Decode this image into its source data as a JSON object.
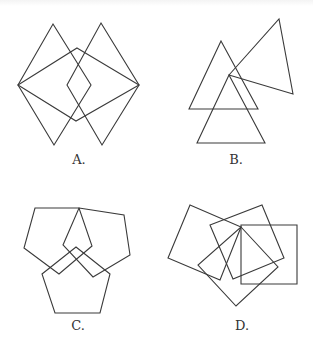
{
  "figure": {
    "stroke_color": "#3a3a3a",
    "background": "#ffffff",
    "panels": [
      {
        "id": "A",
        "label": "A.",
        "label_pos": [
          79,
          155
        ],
        "shape_type": "rhombus",
        "polygons": [
          [
            [
              53,
              24
            ],
            [
              91,
              85
            ],
            [
              54,
              145
            ],
            [
              18,
              85
            ]
          ],
          [
            [
              101,
              23
            ],
            [
              139,
              85
            ],
            [
              102,
              145
            ],
            [
              67,
              85
            ]
          ],
          [
            [
              77,
              48
            ],
            [
              139,
              85
            ],
            [
              76,
              121
            ],
            [
              18,
              85
            ]
          ]
        ]
      },
      {
        "id": "B",
        "label": "B.",
        "label_pos": [
          236,
          155
        ],
        "shape_type": "triangle",
        "polygons": [
          [
            [
              221,
              41
            ],
            [
              258,
              109
            ],
            [
              189,
              109
            ]
          ],
          [
            [
              229,
              75
            ],
            [
              265,
              143
            ],
            [
              197,
              143
            ]
          ],
          [
            [
              229,
              75
            ],
            [
              279,
              19
            ],
            [
              293,
              94
            ]
          ]
        ]
      },
      {
        "id": "C",
        "label": "C.",
        "label_pos": [
          78,
          321
        ],
        "shape_type": "pentagon",
        "polygons": [
          [
            [
              35,
              208
            ],
            [
              79,
              208
            ],
            [
              92,
              246
            ],
            [
              59,
              274
            ],
            [
              24,
              248
            ]
          ],
          [
            [
              79,
              208
            ],
            [
              124,
              215
            ],
            [
              130,
              255
            ],
            [
              93,
              277
            ],
            [
              63,
              245
            ]
          ],
          [
            [
              76,
              247
            ],
            [
              110,
              274
            ],
            [
              100,
              313
            ],
            [
              55,
              313
            ],
            [
              42,
              274
            ]
          ]
        ]
      },
      {
        "id": "D",
        "label": "D.",
        "label_pos": [
          242,
          321
        ],
        "shape_type": "square",
        "polygons": [
          [
            [
              190,
              205
            ],
            [
              241,
              227
            ],
            [
              220,
              280
            ],
            [
              168,
              258
            ]
          ],
          [
            [
              210,
              225
            ],
            [
              262,
              205
            ],
            [
              284,
              258
            ],
            [
              233,
              279
            ]
          ],
          [
            [
              241,
              225
            ],
            [
              297,
              225
            ],
            [
              297,
              284
            ],
            [
              241,
              284
            ]
          ],
          [
            [
              241,
              227
            ],
            [
              278,
              267
            ],
            [
              236,
              306
            ],
            [
              198,
              265
            ]
          ]
        ]
      }
    ]
  }
}
